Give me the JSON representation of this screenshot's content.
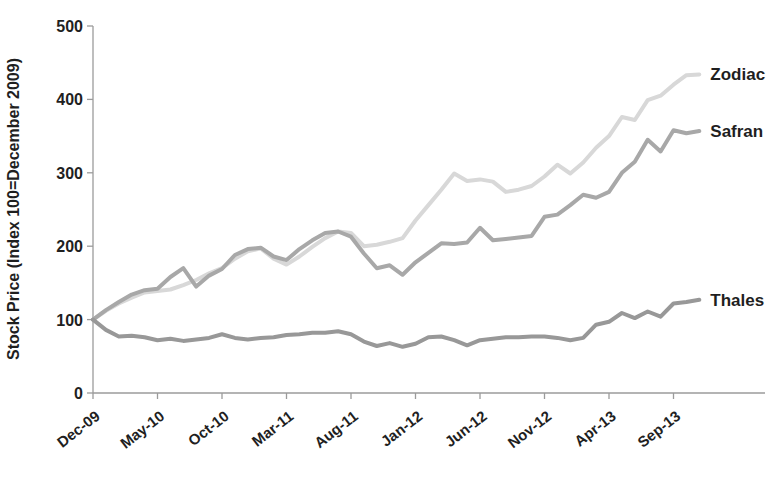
{
  "chart_data": {
    "type": "line",
    "title": "",
    "y_axis": {
      "label": "Stock Price (Index 100=December 2009)",
      "ticks": [
        "0",
        "100",
        "200",
        "300",
        "400",
        "500"
      ],
      "tick_values": [
        0,
        100,
        200,
        300,
        400,
        500
      ],
      "range": [
        0,
        500
      ],
      "grid": false
    },
    "x_axis": {
      "unit": "month",
      "n_points": 48,
      "first_point": "Dec-09",
      "last_point": "Nov-13",
      "tick_labels": [
        "Dec-09",
        "May-10",
        "Oct-10",
        "Mar-11",
        "Aug-11",
        "Jan-12",
        "Jun-12",
        "Nov-12",
        "Apr-13",
        "Sep-13"
      ],
      "tick_indices": [
        0,
        5,
        10,
        15,
        20,
        25,
        30,
        35,
        40,
        45
      ]
    },
    "legend_position": "end-of-line-labels",
    "series": [
      {
        "name": "Zodiac",
        "color": "#d8d8d8",
        "values": [
          100,
          112,
          122,
          130,
          137,
          139,
          141,
          147,
          154,
          163,
          170,
          183,
          193,
          197,
          183,
          175,
          186,
          199,
          211,
          220,
          218,
          200,
          202,
          206,
          211,
          235,
          256,
          277,
          299,
          289,
          291,
          288,
          274,
          277,
          282,
          295,
          311,
          299,
          314,
          334,
          350,
          376,
          372,
          399,
          405,
          420,
          433,
          434
        ]
      },
      {
        "name": "Safran",
        "color": "#a8a8a8",
        "values": [
          100,
          113,
          124,
          134,
          140,
          142,
          158,
          170,
          145,
          160,
          169,
          188,
          196,
          198,
          186,
          181,
          196,
          208,
          218,
          220,
          213,
          190,
          170,
          174,
          161,
          178,
          191,
          204,
          203,
          205,
          225,
          208,
          210,
          212,
          214,
          240,
          243,
          256,
          270,
          266,
          274,
          300,
          315,
          345,
          329,
          358,
          354,
          357
        ]
      },
      {
        "name": "Thales",
        "color": "#989898",
        "values": [
          100,
          86,
          77,
          78,
          76,
          72,
          74,
          71,
          73,
          75,
          80,
          75,
          73,
          75,
          76,
          79,
          80,
          82,
          82,
          84,
          80,
          70,
          64,
          68,
          63,
          67,
          76,
          77,
          72,
          65,
          72,
          74,
          76,
          76,
          77,
          77,
          75,
          72,
          75,
          93,
          97,
          109,
          102,
          111,
          104,
          122,
          124,
          127
        ]
      }
    ]
  }
}
